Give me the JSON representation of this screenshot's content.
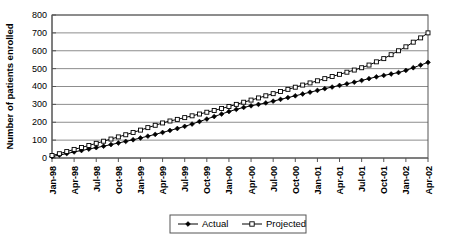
{
  "chart_data": {
    "type": "line",
    "title": "",
    "xlabel": "",
    "ylabel": "Number of patients enrolled",
    "ylim": [
      0,
      800
    ],
    "yticks": [
      0,
      100,
      200,
      300,
      400,
      500,
      600,
      700,
      800
    ],
    "ytick_labels": [
      "0",
      "100",
      "200",
      "300",
      "400",
      "500",
      "600",
      "700",
      "800"
    ],
    "grid": true,
    "legend_position": "bottom",
    "x": [
      "Jan-98",
      "Feb-98",
      "Mar-98",
      "Apr-98",
      "May-98",
      "Jun-98",
      "Jul-98",
      "Aug-98",
      "Sep-98",
      "Oct-98",
      "Nov-98",
      "Dec-98",
      "Jan-99",
      "Feb-99",
      "Mar-99",
      "Apr-99",
      "May-99",
      "Jun-99",
      "Jul-99",
      "Aug-99",
      "Sep-99",
      "Oct-99",
      "Nov-99",
      "Dec-99",
      "Jan-00",
      "Feb-00",
      "Mar-00",
      "Apr-00",
      "May-00",
      "Jun-00",
      "Jul-00",
      "Aug-00",
      "Sep-00",
      "Oct-00",
      "Nov-00",
      "Dec-00",
      "Jan-01",
      "Feb-01",
      "Mar-01",
      "Apr-01",
      "May-01",
      "Jun-01",
      "Jul-01",
      "Aug-01",
      "Sep-01",
      "Oct-01",
      "Nov-01",
      "Dec-01",
      "Jan-02",
      "Feb-02",
      "Mar-02",
      "Apr-02"
    ],
    "xtick_labels": [
      "Jan-98",
      "Apr-98",
      "Jul-98",
      "Oct-98",
      "Jan-99",
      "Apr-99",
      "Jul-99",
      "Oct-99",
      "Jan-00",
      "Apr-00",
      "Jul-00",
      "Oct-00",
      "Jan-01",
      "Apr-01",
      "Jul-01",
      "Oct-01",
      "Jan-02",
      "Apr-02"
    ],
    "series": [
      {
        "name": "Actual",
        "marker": "filled-diamond",
        "color": "#000000",
        "values": [
          8,
          16,
          25,
          34,
          42,
          50,
          58,
          66,
          75,
          84,
          93,
          102,
          112,
          122,
          132,
          143,
          154,
          165,
          177,
          190,
          204,
          218,
          232,
          246,
          260,
          272,
          283,
          292,
          300,
          308,
          318,
          328,
          338,
          348,
          358,
          368,
          378,
          388,
          397,
          406,
          415,
          424,
          434,
          444,
          454,
          462,
          470,
          478,
          490,
          505,
          520,
          535
        ]
      },
      {
        "name": "Projected",
        "marker": "open-square",
        "color": "#000000",
        "values": [
          14,
          24,
          36,
          48,
          59,
          70,
          82,
          94,
          106,
          118,
          130,
          143,
          156,
          170,
          183,
          196,
          207,
          216,
          226,
          236,
          246,
          256,
          266,
          277,
          288,
          300,
          312,
          324,
          336,
          348,
          360,
          372,
          384,
          396,
          408,
          420,
          432,
          444,
          456,
          468,
          480,
          492,
          505,
          520,
          538,
          556,
          578,
          600,
          622,
          648,
          672,
          700
        ]
      }
    ]
  },
  "legend": {
    "items": [
      {
        "label": "Actual"
      },
      {
        "label": "Projected"
      }
    ]
  },
  "axes": {
    "y_title": "Number of patients enrolled"
  }
}
